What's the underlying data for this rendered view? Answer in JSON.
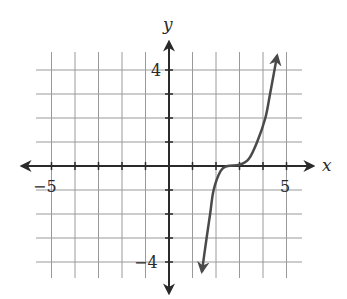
{
  "chart_data": {
    "type": "line",
    "title": "",
    "xlabel": "x",
    "ylabel": "y",
    "xlim": [
      -6,
      6
    ],
    "ylim": [
      -5,
      5
    ],
    "grid": true,
    "x_tick_labels": [
      {
        "value": -5,
        "label": "−5"
      },
      {
        "value": 5,
        "label": "5"
      }
    ],
    "y_tick_labels": [
      {
        "value": 4,
        "label": "4"
      },
      {
        "value": -4,
        "label": "−4"
      }
    ],
    "grid_x": [
      -5,
      -4,
      -3,
      -2,
      -1,
      1,
      2,
      3,
      4,
      5
    ],
    "grid_y": [
      -4,
      -3,
      -2,
      -1,
      1,
      2,
      3,
      4
    ],
    "series": [
      {
        "name": "curve",
        "description": "cubic-like curve with flat inflection near x≈2.5, arrows at both ends",
        "points": [
          {
            "x": 1.4,
            "y": -4.4
          },
          {
            "x": 1.6,
            "y": -3
          },
          {
            "x": 1.75,
            "y": -2
          },
          {
            "x": 1.9,
            "y": -1
          },
          {
            "x": 2.2,
            "y": -0.2
          },
          {
            "x": 2.5,
            "y": 0
          },
          {
            "x": 3.0,
            "y": 0.05
          },
          {
            "x": 3.4,
            "y": 0.3
          },
          {
            "x": 3.75,
            "y": 1
          },
          {
            "x": 4.1,
            "y": 2
          },
          {
            "x": 4.3,
            "y": 3
          },
          {
            "x": 4.6,
            "y": 4.6
          }
        ]
      }
    ]
  },
  "labels": {
    "x_axis": "x",
    "y_axis": "y",
    "x_neg": "−5",
    "x_pos": "5",
    "y_pos": "4",
    "y_neg": "−4"
  },
  "colors": {
    "grid": "#9a9a9a",
    "axis": "#2a2a2a",
    "curve": "#4a4a4a"
  }
}
